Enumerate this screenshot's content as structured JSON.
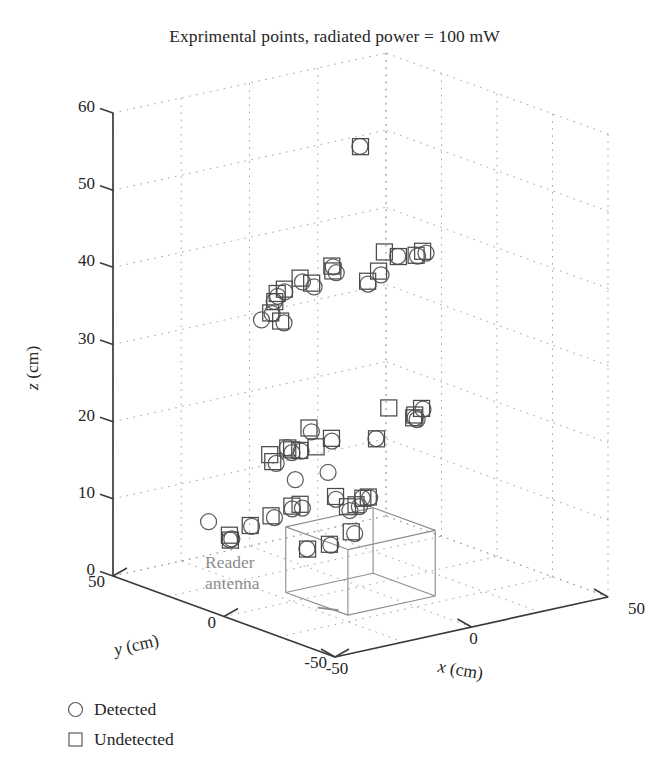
{
  "title": "Exprimental points, radiated power = 100 mW",
  "annotation": {
    "line1": "Reader",
    "line2": "antenna"
  },
  "axes": {
    "z": {
      "name_italic": "z",
      "name_unit": " (cm)",
      "ticks": [
        "0",
        "10",
        "20",
        "30",
        "40",
        "50",
        "60"
      ],
      "min": 0,
      "max": 60
    },
    "x": {
      "name_italic": "x",
      "name_unit": " (cm)",
      "ticks": [
        "-50",
        "0",
        "50"
      ],
      "min": -50,
      "max": 50
    },
    "y": {
      "name_italic": "y",
      "name_unit": " (cm)",
      "ticks": [
        "50",
        "0",
        "-50"
      ],
      "min": -50,
      "max": 50
    }
  },
  "legend": [
    {
      "marker": "circle-marker",
      "label": "Detected"
    },
    {
      "marker": "square-marker",
      "label": "Undetected"
    }
  ],
  "colors": {
    "axis": "#3b3b3b",
    "grid": "#9a9a9a",
    "marker": "#4b4b4b",
    "annotation": "#8d8d8d",
    "antenna": "#8f8f8f",
    "background": "#ffffff"
  },
  "chart_data": {
    "type": "scatter",
    "title": "Exprimental points, radiated power = 100 mW",
    "xlabel": "x (cm)",
    "ylabel": "y (cm)",
    "zlabel": "z (cm)",
    "xlim": [
      -50,
      50
    ],
    "ylim": [
      -50,
      50
    ],
    "zlim": [
      0,
      60
    ],
    "grid": true,
    "legend_position": "below-left",
    "projection": "3d",
    "series": [
      {
        "name": "Detected",
        "marker": "circle",
        "points": [
          [
            -20,
            20,
            34
          ],
          [
            -6,
            22,
            12
          ],
          [
            6,
            22,
            12
          ],
          [
            -28,
            34,
            7
          ]
        ]
      },
      {
        "name": "Undetected",
        "marker": "square",
        "points": [
          [
            0,
            0,
            57
          ],
          [
            -28,
            6,
            37
          ],
          [
            -26,
            4,
            36
          ],
          [
            -24,
            8,
            39
          ],
          [
            -14,
            10,
            40
          ],
          [
            -20,
            14,
            37
          ],
          [
            -4,
            8,
            41
          ],
          [
            -2,
            10,
            40
          ],
          [
            -10,
            22,
            37
          ],
          [
            0,
            22,
            37
          ],
          [
            12,
            4,
            42
          ],
          [
            22,
            2,
            41
          ],
          [
            26,
            4,
            41
          ],
          [
            14,
            14,
            37
          ],
          [
            18,
            14,
            38
          ],
          [
            22,
            10,
            40
          ],
          [
            -30,
            4,
            19
          ],
          [
            -24,
            10,
            17
          ],
          [
            -22,
            4,
            19
          ],
          [
            -14,
            6,
            21
          ],
          [
            -12,
            18,
            17
          ],
          [
            -6,
            20,
            16
          ],
          [
            0,
            20,
            16
          ],
          [
            4,
            18,
            17
          ],
          [
            12,
            2,
            22
          ],
          [
            14,
            10,
            17
          ],
          [
            24,
            2,
            21
          ],
          [
            26,
            8,
            19
          ],
          [
            28,
            10,
            19
          ],
          [
            -22,
            32,
            5
          ],
          [
            -20,
            34,
            4
          ],
          [
            -16,
            30,
            6
          ],
          [
            -10,
            28,
            7
          ],
          [
            -4,
            26,
            8
          ],
          [
            -1,
            26,
            8
          ],
          [
            -8,
            14,
            4
          ],
          [
            0,
            14,
            4
          ],
          [
            8,
            14,
            5
          ],
          [
            12,
            26,
            8
          ],
          [
            18,
            28,
            6
          ],
          [
            22,
            26,
            7
          ],
          [
            24,
            26,
            7
          ],
          [
            26,
            34,
            5
          ]
        ]
      }
    ],
    "annotations": [
      {
        "text": "Reader antenna",
        "x": -30,
        "y": 10,
        "z": 0
      }
    ]
  }
}
